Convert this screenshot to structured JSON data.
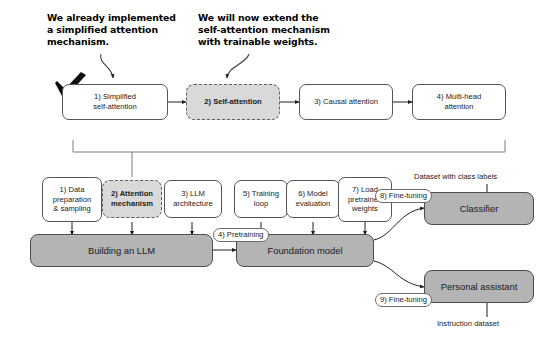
{
  "diagram": {
    "colors": {
      "filled_node": "#b4b4b4",
      "highlight_node": "#d9d9d9",
      "node_border": "#4d4d4d",
      "text": "#1a1a1a",
      "callout_text": "#000000"
    },
    "callouts": [
      {
        "id": "callout-implemented",
        "text": "We already implemented\na simplified attention\nmechanism."
      },
      {
        "id": "callout-extend",
        "text": "We will now extend the\nself-attention mechanism\nwith trainable weights."
      }
    ],
    "attention_stages": [
      {
        "id": "stage-1",
        "label": "1) Simplified\nself-attention",
        "highlighted": false
      },
      {
        "id": "stage-2",
        "label": "2) Self-attention",
        "highlighted": true
      },
      {
        "id": "stage-3",
        "label": "3) Causal attention",
        "highlighted": false
      },
      {
        "id": "stage-4",
        "label": "4) Multi-head\nattention",
        "highlighted": false
      }
    ],
    "build_steps": [
      {
        "id": "step-1",
        "label": "1) Data\npreparation\n& sampling",
        "highlighted": false
      },
      {
        "id": "step-2",
        "label": "2) Attention\nmechanism",
        "highlighted": true
      },
      {
        "id": "step-3",
        "label": "3) LLM\narchitecture",
        "highlighted": false
      },
      {
        "id": "step-5",
        "label": "5) Training\nloop",
        "highlighted": false
      },
      {
        "id": "step-6",
        "label": "6) Model\nevaluation",
        "highlighted": false
      },
      {
        "id": "step-7",
        "label": "7) Load\npretrained\nweights",
        "highlighted": false
      }
    ],
    "main_stages": [
      {
        "id": "building-an-llm",
        "label": "Building an LLM"
      },
      {
        "id": "foundation-model",
        "label": "Foundation model"
      },
      {
        "id": "classifier",
        "label": "Classifier"
      },
      {
        "id": "personal-assistant",
        "label": "Personal assistant"
      }
    ],
    "edge_labels": [
      {
        "id": "pretraining",
        "label": "4) Pretraining"
      },
      {
        "id": "finetuning-classifier",
        "label": "8) Fine-tuning"
      },
      {
        "id": "finetuning-assistant",
        "label": "9) Fine-tuning"
      }
    ],
    "dataset_labels": [
      {
        "id": "dataset-class-labels",
        "label": "Dataset with class labels"
      },
      {
        "id": "dataset-instruction",
        "label": "Instruction dataset"
      }
    ],
    "icons": {
      "checkmark": "checkmark-icon"
    }
  }
}
